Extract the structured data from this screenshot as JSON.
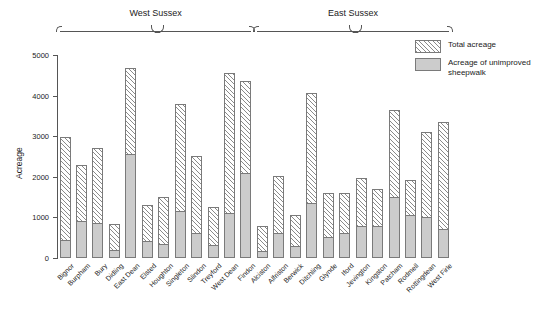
{
  "chart_data": {
    "type": "bar",
    "title": "",
    "subtitle": "",
    "xlabel": "",
    "ylabel": "Acreage",
    "ylim": [
      0,
      5000
    ],
    "yticks": [
      0,
      1000,
      2000,
      3000,
      4000,
      5000
    ],
    "grid": false,
    "legend_position": "top-right",
    "stacked_overlay": true,
    "categories": [
      "Bignor",
      "Burpham",
      "Bury",
      "Didling",
      "East Dean",
      "Elsted",
      "Houghton",
      "Singleton",
      "Slindon",
      "Treyford",
      "West Dean",
      "Findon",
      "Alciston",
      "Alfriston",
      "Berwick",
      "Ditchling",
      "Glynde",
      "Iford",
      "Jevington",
      "Kingston",
      "Patcham",
      "Rodmell",
      "Rottingdean",
      "West Firle"
    ],
    "series": [
      {
        "name": "Total acreage",
        "style": "hatched",
        "values": [
          2980,
          2300,
          2720,
          830,
          4670,
          1300,
          1500,
          3790,
          2520,
          1260,
          4560,
          4360,
          790,
          2020,
          1060,
          4060,
          1600,
          1610,
          1960,
          1690,
          3640,
          1930,
          3110,
          3340
        ]
      },
      {
        "name": "Acreage of unimproved sheepwalk",
        "style": "solid-gray",
        "values": [
          450,
          900,
          860,
          200,
          2550,
          430,
          350,
          1150,
          610,
          320,
          1100,
          2100,
          170,
          610,
          300,
          1350,
          520,
          620,
          790,
          780,
          1500,
          1070,
          1020,
          720
        ]
      }
    ],
    "groups": [
      {
        "label": "West Sussex",
        "start_index": 0,
        "end_index": 11
      },
      {
        "label": "East Sussex",
        "start_index": 12,
        "end_index": 23
      }
    ]
  },
  "legend": {
    "entries": [
      {
        "label": "Total acreage",
        "swatch": "hatched"
      },
      {
        "label": "Acreage of unimproved sheepwalk",
        "swatch": "solid-gray"
      }
    ]
  },
  "colors": {
    "hatch_line": "#8a8a8a",
    "gray_fill": "#cccccc",
    "outline": "#7a7a7a",
    "axis": "#555555",
    "text": "#222222",
    "background": "#ffffff"
  }
}
